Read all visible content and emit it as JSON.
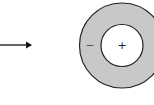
{
  "diagram": {
    "arrow": {
      "direction": "right",
      "color": "#111111"
    },
    "annulus": {
      "fill_color": "#c8c8c8",
      "stroke_color": "#222222",
      "inner_fill_color": "#ffffff",
      "outer_label": "−",
      "inner_label": "+"
    }
  }
}
